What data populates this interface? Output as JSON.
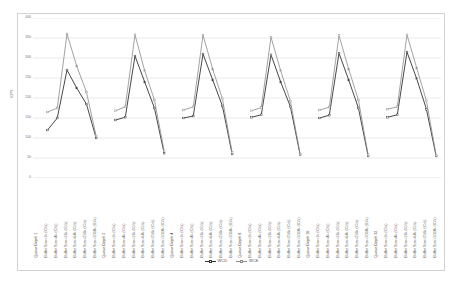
{
  "chart_data": {
    "type": "line",
    "title": "",
    "xlabel": "",
    "ylabel": "IOPS",
    "ylim": [
      0,
      400
    ],
    "ytick_step": 50,
    "ytick_labels": [
      "0",
      "50",
      "100",
      "150",
      "200",
      "250",
      "300",
      "350",
      "400"
    ],
    "grid": true,
    "legend_position": "bottom",
    "groups": [
      {
        "group_label": "Queue Depth 1",
        "categories": [
          "Buffer Size=1k (IO/s)",
          "Buffer Size=4k (IO/s)",
          "Buffer Size=16k (IO/s)",
          "Buffer Size=64k (IO/s)",
          "Buffer Size=256k (IO/s)",
          "Buffer Size=1024k (IO/s)"
        ]
      },
      {
        "group_label": "Queue Depth 2",
        "categories": [
          "Buffer Size=1k (IO/s)",
          "Buffer Size=4k (IO/s)",
          "Buffer Size=16k (IO/s)",
          "Buffer Size=64k (IO/s)",
          "Buffer Size=256k (IO/s)",
          "Buffer Size=1024k (IO/s)"
        ]
      },
      {
        "group_label": "Queue Depth 4",
        "categories": [
          "Buffer Size=1k (IO/s)",
          "Buffer Size=4k (IO/s)",
          "Buffer Size=16k (IO/s)",
          "Buffer Size=64k (IO/s)",
          "Buffer Size=256k (IO/s)",
          "Buffer Size=1024k (IO/s)"
        ]
      },
      {
        "group_label": "Queue Depth 8",
        "categories": [
          "Buffer Size=1k (IO/s)",
          "Buffer Size=4k (IO/s)",
          "Buffer Size=16k (IO/s)",
          "Buffer Size=64k (IO/s)",
          "Buffer Size=256k (IO/s)",
          "Buffer Size=1024k (IO/s)"
        ]
      },
      {
        "group_label": "Queue Depth 16",
        "categories": [
          "Buffer Size=1k (IO/s)",
          "Buffer Size=4k (IO/s)",
          "Buffer Size=16k (IO/s)",
          "Buffer Size=64k (IO/s)",
          "Buffer Size=256k (IO/s)",
          "Buffer Size=1024k (IO/s)"
        ]
      },
      {
        "group_label": "Queue Depth 32",
        "categories": [
          "Buffer Size=1k (IO/s)",
          "Buffer Size=4k (IO/s)",
          "Buffer Size=16k (IO/s)",
          "Buffer Size=64k (IO/s)",
          "Buffer Size=256k (IO/s)",
          "Buffer Size=1024k (IO/s)"
        ]
      }
    ],
    "series": [
      {
        "name": "WCD",
        "color": "#333333",
        "values": [
          120,
          150,
          270,
          225,
          185,
          100,
          145,
          152,
          305,
          240,
          175,
          62,
          150,
          155,
          310,
          245,
          180,
          60,
          152,
          158,
          308,
          240,
          178,
          58,
          150,
          157,
          312,
          245,
          175,
          55,
          152,
          158,
          315,
          248,
          172,
          55
        ]
      },
      {
        "name": "WCE",
        "color": "#8c8c8c",
        "values": [
          165,
          175,
          360,
          280,
          215,
          105,
          168,
          178,
          358,
          268,
          195,
          68,
          170,
          178,
          357,
          272,
          198,
          64,
          168,
          176,
          352,
          268,
          192,
          60,
          170,
          177,
          356,
          272,
          195,
          58,
          172,
          178,
          358,
          275,
          193,
          57
        ]
      }
    ]
  }
}
